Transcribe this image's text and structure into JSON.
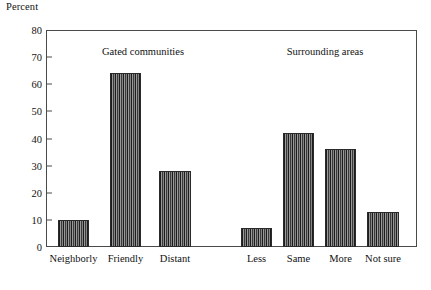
{
  "chart_data": {
    "type": "bar",
    "title": "",
    "ylabel": "Percent",
    "xlabel": "",
    "ylim": [
      0,
      80
    ],
    "yticks": [
      0,
      10,
      20,
      30,
      40,
      50,
      60,
      70,
      80
    ],
    "grid": false,
    "legend": null,
    "categories": [
      "Neighborly",
      "Friendly",
      "Distant",
      "Less",
      "Same",
      "More",
      "Not sure"
    ],
    "values": [
      10,
      64,
      28,
      7,
      42,
      36,
      13
    ],
    "groups": [
      {
        "label": "Gated communities",
        "categories": [
          "Neighborly",
          "Friendly",
          "Distant"
        ],
        "values": [
          10,
          64,
          28
        ]
      },
      {
        "label": "Surrounding areas",
        "categories": [
          "Less",
          "Same",
          "More",
          "Not sure"
        ],
        "values": [
          7,
          42,
          36,
          13
        ]
      }
    ],
    "bar_color": "#555555",
    "bar_pattern": "vertical-hatch"
  },
  "axis": {
    "y_title": "Percent",
    "y_tick_labels": [
      "80",
      "70",
      "60",
      "50",
      "40",
      "30",
      "20",
      "10",
      "0"
    ],
    "x_tick_labels": [
      "Neighborly",
      "Friendly",
      "Distant",
      "Less",
      "Same",
      "More",
      "Not sure"
    ]
  },
  "annotations": {
    "group_left": "Gated communities",
    "group_right": "Surrounding areas"
  }
}
